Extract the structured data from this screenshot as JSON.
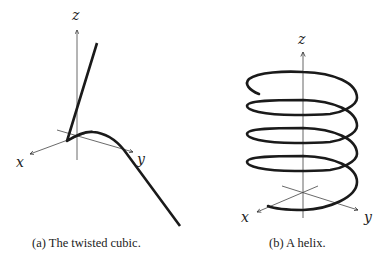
{
  "figure": {
    "panels": [
      {
        "id": "a",
        "caption": "(a) The twisted cubic.",
        "axes": {
          "x": "x",
          "y": "y",
          "z": "z"
        },
        "curve": "twisted cubic"
      },
      {
        "id": "b",
        "caption": "(b) A helix.",
        "axes": {
          "x": "x",
          "y": "y",
          "z": "z"
        },
        "curve": "helix",
        "turns": 4
      }
    ]
  }
}
